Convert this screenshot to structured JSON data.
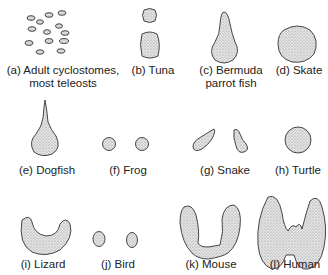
{
  "figure": {
    "fill_color": "#d9d9d9",
    "stroke_color": "#333333",
    "panels": [
      {
        "id": "a",
        "label_line1": "(a) Adult cyclostomes,",
        "label_line2": "most teleosts",
        "shape": "scattered-follicles"
      },
      {
        "id": "b",
        "label_line1": "(b) Tuna",
        "shape": "two-stacked-lobes"
      },
      {
        "id": "c",
        "label_line1": "(c) Bermuda",
        "label_line2": "parrot fish",
        "shape": "gourd"
      },
      {
        "id": "d",
        "label_line1": "(d) Skate",
        "shape": "round-mass"
      },
      {
        "id": "e",
        "label_line1": "(e) Dogfish",
        "shape": "teardrop"
      },
      {
        "id": "f",
        "label_line1": "(f) Frog",
        "shape": "paired-spheres"
      },
      {
        "id": "g",
        "label_line1": "(g) Snake",
        "shape": "paired-elongated"
      },
      {
        "id": "h",
        "label_line1": "(h) Turtle",
        "shape": "single-sphere"
      },
      {
        "id": "i",
        "label_line1": "(i) Lizard",
        "shape": "crescent"
      },
      {
        "id": "j",
        "label_line1": "(j) Bird",
        "shape": "paired-ovals"
      },
      {
        "id": "k",
        "label_line1": "(k) Mouse",
        "shape": "u-shaped-bilobed"
      },
      {
        "id": "l",
        "label_line1": "(l) Human",
        "shape": "bilobed-with-isthmus"
      }
    ]
  }
}
